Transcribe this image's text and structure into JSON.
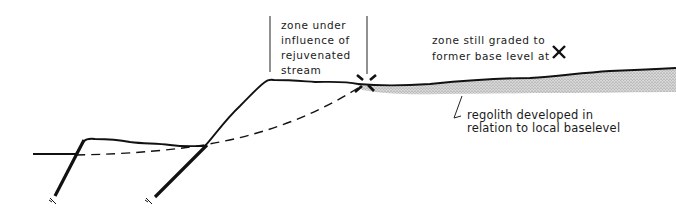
{
  "diagram": {
    "type": "geologic-cross-section",
    "labels": {
      "zone_under_influence": "zone under\ninfluence of\nrejuvenated\nstream",
      "zone_still_graded": "zone still graded to\nformer base level at",
      "regolith": "regolith developed in\nrelation to local baselevel",
      "fault_left": "f",
      "fault_right": "f"
    },
    "symbols": {
      "knickpoint": "x-mark",
      "legend_marker": "x-mark"
    },
    "colors": {
      "line": "#111111",
      "stipple": "#9a9a9a",
      "background": "#ffffff"
    }
  }
}
